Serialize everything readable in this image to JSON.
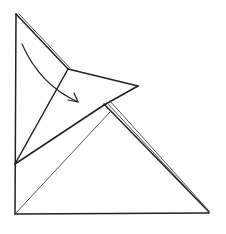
{
  "diagram": {
    "type": "origami-fold-step",
    "colors": {
      "background": "#ffffff",
      "line": "#222222"
    },
    "points": {
      "top_left": [
        16,
        14
      ],
      "inner_vertex": [
        68,
        69
      ],
      "right_tip": [
        138,
        86
      ],
      "left_mid": [
        15,
        164
      ],
      "bottom_left": [
        15,
        214
      ],
      "bottom_right": [
        209,
        212
      ],
      "double_line_start": [
        104,
        105
      ]
    },
    "arrow": {
      "from": [
        22,
        44
      ],
      "to": [
        78,
        102
      ],
      "direction": "clockwise-fold"
    }
  }
}
